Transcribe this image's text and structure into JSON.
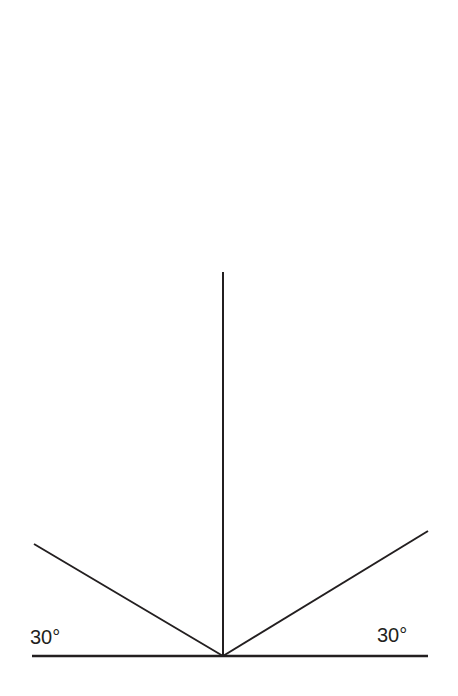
{
  "diagram": {
    "type": "angle-diagram",
    "line_color": "#231f20",
    "background": "#ffffff",
    "labels": {
      "left_angle": "30°",
      "right_angle": "30°"
    },
    "geometry": {
      "baseline": {
        "x1": 32,
        "y1": 656,
        "x2": 428,
        "y2": 656
      },
      "vertical": {
        "x1": 223,
        "y1": 272,
        "x2": 223,
        "y2": 656
      },
      "left_ray": {
        "x1": 223,
        "y1": 656,
        "x2": 34,
        "y2": 544
      },
      "right_ray": {
        "x1": 223,
        "y1": 656,
        "x2": 428,
        "y2": 531
      },
      "vertex": {
        "x": 223,
        "y": 656
      }
    },
    "angles": [
      {
        "position": "left",
        "degrees": 30,
        "between": [
          "baseline",
          "left_ray"
        ]
      },
      {
        "position": "right",
        "degrees": 30,
        "between": [
          "baseline",
          "right_ray"
        ]
      }
    ]
  }
}
